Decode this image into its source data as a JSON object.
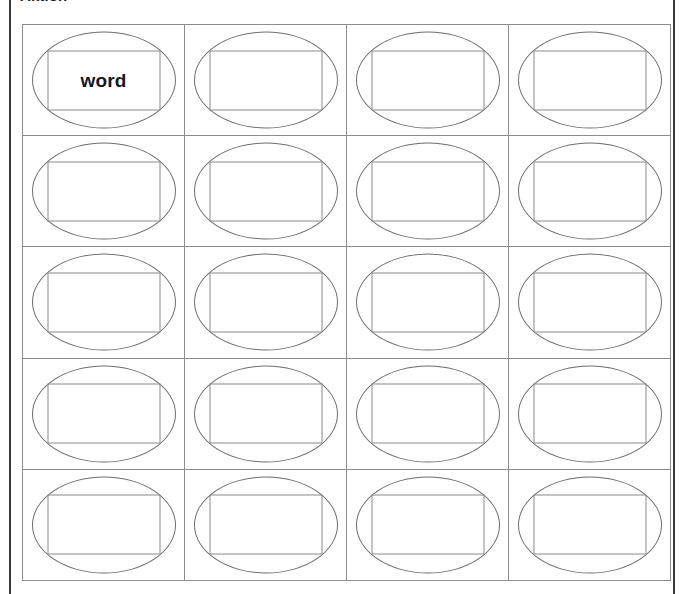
{
  "page": {
    "heading": "Aktion",
    "background_color": "#ffffff",
    "frame_line_color": "#3a3a3a"
  },
  "grid": {
    "columns": 4,
    "rows": 5,
    "cell_border_color": "#8c8c8c",
    "oval_stroke_color": "#6e6e6e",
    "box_stroke_color": "#8a8a8a",
    "word_color": "#16181a",
    "cells": [
      [
        "word",
        "",
        "",
        ""
      ],
      [
        "",
        "",
        "",
        ""
      ],
      [
        "",
        "",
        "",
        ""
      ],
      [
        "",
        "",
        "",
        ""
      ],
      [
        "",
        "",
        "",
        ""
      ]
    ]
  }
}
